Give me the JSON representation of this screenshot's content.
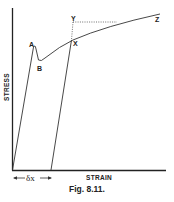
{
  "figure": {
    "caption": "Fig. 8.11.",
    "y_axis_label": "STRESS",
    "x_axis_label": "STRAIN",
    "delta_label": "δx",
    "points": {
      "A": "A",
      "B": "B",
      "X": "X",
      "Y": "Y",
      "Z": "Z"
    }
  }
}
